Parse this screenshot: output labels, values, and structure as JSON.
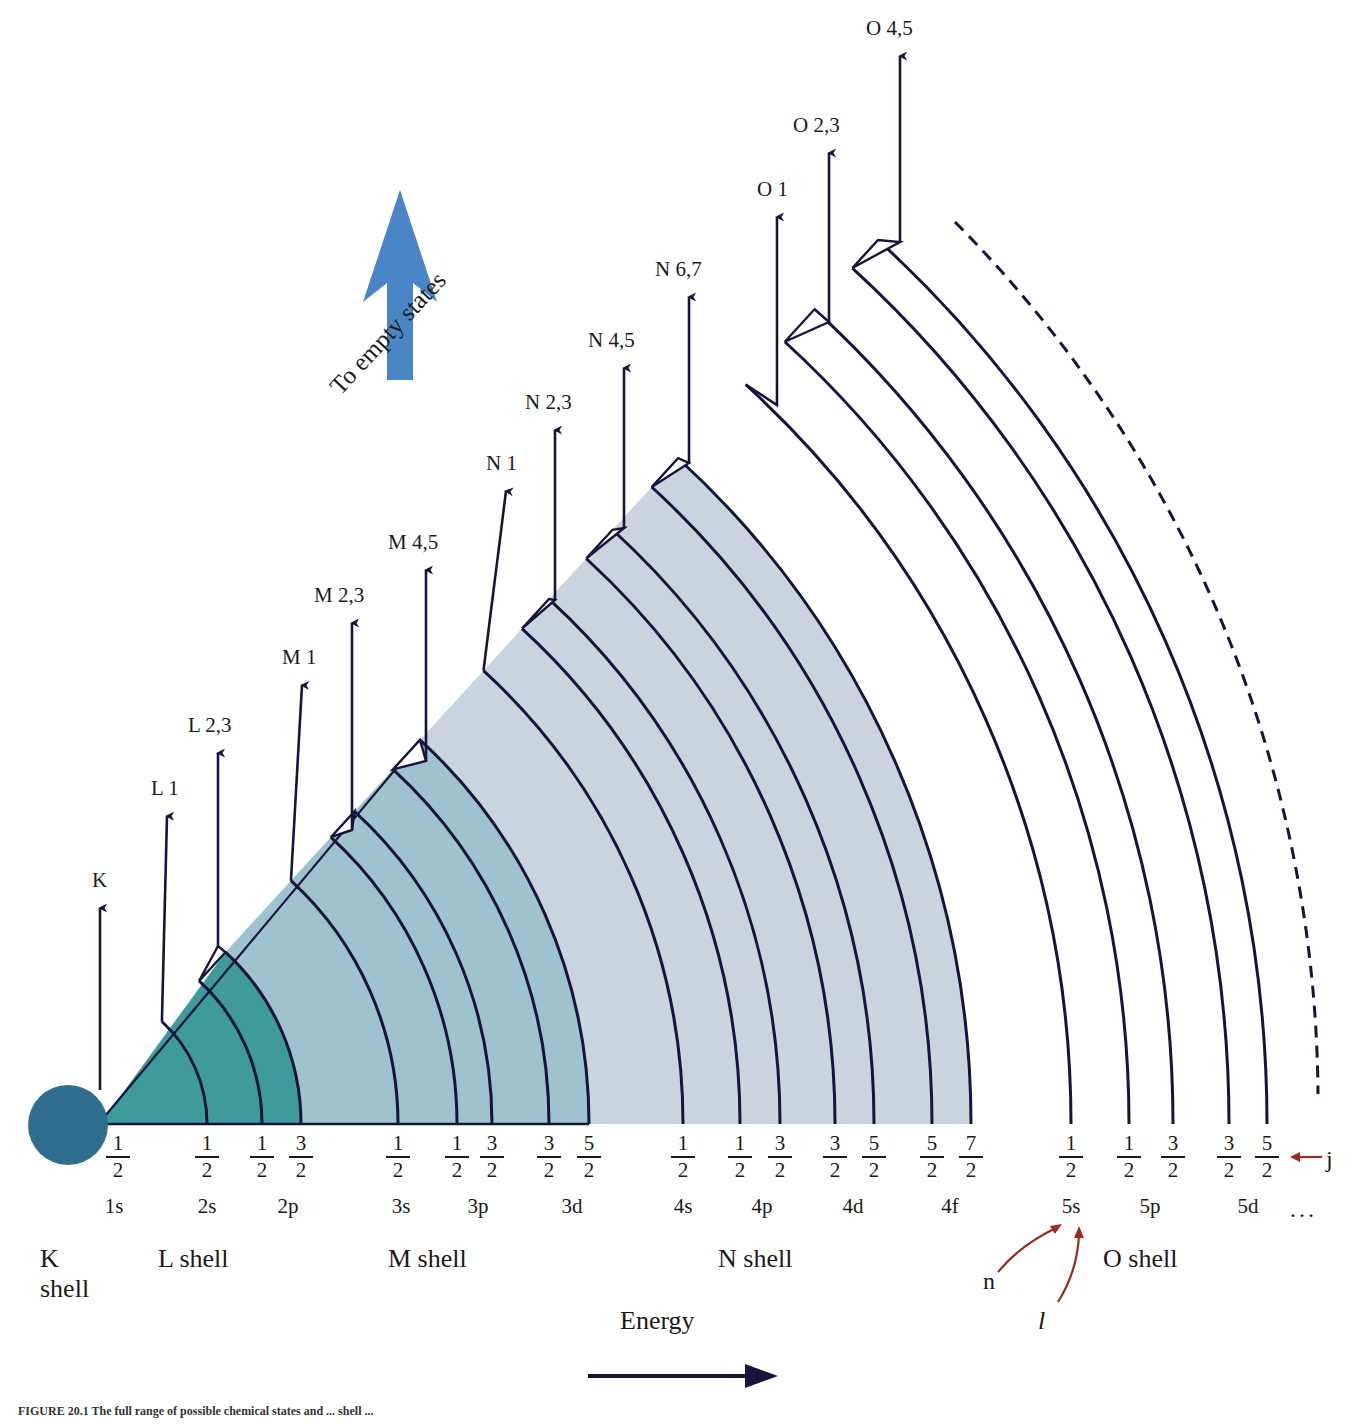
{
  "figure": {
    "caption": "FIGURE 20.1  The full range of possible chemical states and ... shell ...",
    "empty_states_label": "To empty states",
    "energy_label": "Energy",
    "j_label": "j",
    "n_label": "n",
    "l_label": "l",
    "ellipsis": "...",
    "example_annotated_subshell": "5s"
  },
  "colors": {
    "k_circle": "#2f6d8f",
    "l_fill": "#3f9a9c",
    "m_fill": "#9fc2cf",
    "n_fill": "#c9d4de",
    "line": "#16143a",
    "blue_arrow": "#4a86c5",
    "annotation_red": "#9b2a22"
  },
  "levels": [
    {
      "name": "K",
      "label": "K"
    },
    {
      "name": "L1",
      "label": "L 1"
    },
    {
      "name": "L23",
      "label": "L 2,3"
    },
    {
      "name": "M1",
      "label": "M 1"
    },
    {
      "name": "M23",
      "label": "M 2,3"
    },
    {
      "name": "M45",
      "label": "M 4,5"
    },
    {
      "name": "N1",
      "label": "N 1"
    },
    {
      "name": "N23",
      "label": "N 2,3"
    },
    {
      "name": "N45",
      "label": "N 4,5"
    },
    {
      "name": "N67",
      "label": "N 6,7"
    },
    {
      "name": "O1",
      "label": "O 1"
    },
    {
      "name": "O23",
      "label": "O 2,3"
    },
    {
      "name": "O45",
      "label": "O 4,5"
    }
  ],
  "subshells": [
    {
      "label": "1s",
      "j": [
        "1/2"
      ]
    },
    {
      "label": "2s",
      "j": [
        "1/2"
      ]
    },
    {
      "label": "2p",
      "j": [
        "1/2",
        "3/2"
      ]
    },
    {
      "label": "3s",
      "j": [
        "1/2"
      ]
    },
    {
      "label": "3p",
      "j": [
        "1/2",
        "3/2"
      ]
    },
    {
      "label": "3d",
      "j": [
        "3/2",
        "5/2"
      ]
    },
    {
      "label": "4s",
      "j": [
        "1/2"
      ]
    },
    {
      "label": "4p",
      "j": [
        "1/2",
        "3/2"
      ]
    },
    {
      "label": "4d",
      "j": [
        "3/2",
        "5/2"
      ]
    },
    {
      "label": "4f",
      "j": [
        "5/2",
        "7/2"
      ]
    },
    {
      "label": "5s",
      "j": [
        "1/2"
      ]
    },
    {
      "label": "5p",
      "j": [
        "1/2",
        "3/2"
      ]
    },
    {
      "label": "5d",
      "j": [
        "3/2",
        "5/2"
      ]
    }
  ],
  "shells": [
    {
      "label": "K\nshell"
    },
    {
      "label": "L shell"
    },
    {
      "label": "M shell"
    },
    {
      "label": "N shell"
    },
    {
      "label": "O shell"
    }
  ],
  "j_values": [
    {
      "num": "1",
      "den": "2"
    },
    {
      "num": "1",
      "den": "2"
    },
    {
      "num": "1",
      "den": "2"
    },
    {
      "num": "3",
      "den": "2"
    },
    {
      "num": "1",
      "den": "2"
    },
    {
      "num": "1",
      "den": "2"
    },
    {
      "num": "3",
      "den": "2"
    },
    {
      "num": "3",
      "den": "2"
    },
    {
      "num": "5",
      "den": "2"
    },
    {
      "num": "1",
      "den": "2"
    },
    {
      "num": "1",
      "den": "2"
    },
    {
      "num": "3",
      "den": "2"
    },
    {
      "num": "3",
      "den": "2"
    },
    {
      "num": "5",
      "den": "2"
    },
    {
      "num": "5",
      "den": "2"
    },
    {
      "num": "7",
      "den": "2"
    },
    {
      "num": "1",
      "den": "2"
    },
    {
      "num": "1",
      "den": "2"
    },
    {
      "num": "3",
      "den": "2"
    },
    {
      "num": "3",
      "den": "2"
    },
    {
      "num": "5",
      "den": "2"
    }
  ]
}
